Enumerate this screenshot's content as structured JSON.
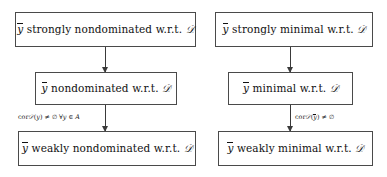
{
  "diagram": {
    "columns": [
      {
        "name": "nondominated-chain",
        "boxes": [
          {
            "id": "strongly-nondominated",
            "text": "ȳ strongly nondominated w.r.t. 𝒟",
            "variable": "y",
            "qualifier": "strongly nondominated",
            "relation": "w.r.t.",
            "set": "𝒟"
          },
          {
            "id": "nondominated",
            "text": "ȳ nondominated w.r.t. 𝒟",
            "variable": "y",
            "qualifier": "nondominated",
            "relation": "w.r.t.",
            "set": "𝒟"
          },
          {
            "id": "weakly-nondominated",
            "text": "ȳ weakly nondominated w.r.t. 𝒟",
            "variable": "y",
            "qualifier": "weakly nondominated",
            "relation": "w.r.t.",
            "set": "𝒟"
          }
        ],
        "arrows": [
          {
            "id": "arrow-strongly-to-nondominated",
            "label": ""
          },
          {
            "id": "arrow-nondominated-to-weakly",
            "label": "cor 𝒟(y) ≠ ∅ ∀y ∈ A",
            "label_parts": {
              "operator": "cor",
              "set": "𝒟",
              "argument": "y",
              "comparator": "≠",
              "empty": "∅",
              "quantifier": "∀",
              "quantified_var": "y",
              "member": "∈",
              "domain": "A"
            }
          }
        ]
      },
      {
        "name": "minimal-chain",
        "boxes": [
          {
            "id": "strongly-minimal",
            "text": "ȳ strongly minimal w.r.t. 𝒟",
            "variable": "y",
            "qualifier": "strongly minimal",
            "relation": "w.r.t.",
            "set": "𝒟"
          },
          {
            "id": "minimal",
            "text": "ȳ minimal w.r.t. 𝒟",
            "variable": "y",
            "qualifier": "minimal",
            "relation": "w.r.t.",
            "set": "𝒟"
          },
          {
            "id": "weakly-minimal",
            "text": "ȳ weakly minimal w.r.t. 𝒟",
            "variable": "y",
            "qualifier": "weakly minimal",
            "relation": "w.r.t.",
            "set": "𝒟"
          }
        ],
        "arrows": [
          {
            "id": "arrow-strongly-to-minimal",
            "label": ""
          },
          {
            "id": "arrow-minimal-to-weakly",
            "label": "cor 𝒟(ȳ) ≠ ∅",
            "label_parts": {
              "operator": "cor",
              "set": "𝒟",
              "argument": "ȳ",
              "comparator": "≠",
              "empty": "∅"
            }
          }
        ]
      }
    ],
    "symbols": {
      "variable_y": "y",
      "calligraphic_D": "𝒟",
      "wrt": "w.r.t.",
      "cor": "cor",
      "neq": "≠",
      "emptyset": "∅",
      "forall": "∀",
      "in": "∈",
      "set_A": "A"
    },
    "colors": {
      "background": "#ffffff",
      "box_border": "#4a4a4a",
      "text": "#111111",
      "arrow": "#3a3a3a"
    }
  }
}
